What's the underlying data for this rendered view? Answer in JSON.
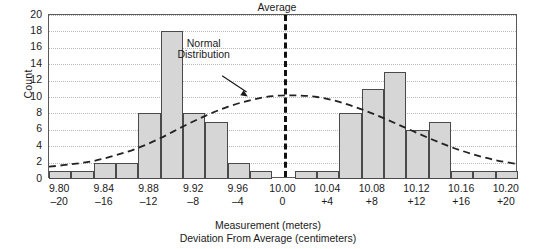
{
  "chart_data": {
    "type": "bar",
    "title": "",
    "ylabel": "Count",
    "xlabel": "Measurement (meters)",
    "xlabel2": "Deviation From Average (centimeters)",
    "ylim": [
      0,
      20
    ],
    "ytick_step": 2,
    "yticks": [
      0,
      2,
      4,
      6,
      8,
      10,
      12,
      14,
      16,
      18,
      20
    ],
    "grid": true,
    "legend": "none",
    "bin_width_meters": 0.02,
    "bin_width_cm": 2,
    "x_start_meters": 9.79,
    "x_end_meters": 10.21,
    "categories": [
      "9.79-9.81",
      "9.81-9.83",
      "9.83-9.85",
      "9.85-9.87",
      "9.87-9.89",
      "9.89-9.91",
      "9.91-9.93",
      "9.93-9.95",
      "9.95-9.97",
      "9.97-9.99",
      "9.99-10.01",
      "10.01-10.03",
      "10.03-10.05",
      "10.05-10.07",
      "10.07-10.09",
      "10.09-10.11",
      "10.11-10.13",
      "10.13-10.15",
      "10.15-10.17",
      "10.17-10.19",
      "10.19-10.21"
    ],
    "values": [
      1,
      1,
      2,
      2,
      8,
      18,
      8,
      7,
      2,
      1,
      0,
      1,
      1,
      8,
      11,
      13,
      6,
      7,
      1,
      1,
      1
    ],
    "xtick_measure": [
      "9.80",
      "9.84",
      "9.88",
      "9.92",
      "9.96",
      "10.00",
      "10.04",
      "10.08",
      "10.12",
      "10.16",
      "10.20"
    ],
    "xtick_deviation": [
      "–20",
      "–16",
      "–12",
      "–8",
      "–4",
      "0",
      "+4",
      "+8",
      "+12",
      "+16",
      "+20"
    ],
    "annotations": [
      {
        "name": "average",
        "label": "Average",
        "x_meters": 10.0,
        "style": "vertical-dashed-line"
      },
      {
        "name": "normal-distribution",
        "label_line1": "Normal",
        "label_line2": "Distribution",
        "style": "dashed-curve-with-arrow"
      }
    ],
    "normal_curve": {
      "label": "Normal Distribution",
      "peak_count": 10.2,
      "peak_x_meters": 10.0,
      "points": [
        {
          "x": 9.79,
          "y": 1.5
        },
        {
          "x": 9.81,
          "y": 1.8
        },
        {
          "x": 9.83,
          "y": 2.2
        },
        {
          "x": 9.85,
          "y": 2.9
        },
        {
          "x": 9.87,
          "y": 3.8
        },
        {
          "x": 9.89,
          "y": 5.0
        },
        {
          "x": 9.91,
          "y": 6.4
        },
        {
          "x": 9.93,
          "y": 7.7
        },
        {
          "x": 9.95,
          "y": 8.8
        },
        {
          "x": 9.97,
          "y": 9.6
        },
        {
          "x": 9.99,
          "y": 10.1
        },
        {
          "x": 10.01,
          "y": 10.2
        },
        {
          "x": 10.03,
          "y": 10.0
        },
        {
          "x": 10.05,
          "y": 9.4
        },
        {
          "x": 10.07,
          "y": 8.5
        },
        {
          "x": 10.09,
          "y": 7.4
        },
        {
          "x": 10.11,
          "y": 6.2
        },
        {
          "x": 10.13,
          "y": 5.0
        },
        {
          "x": 10.15,
          "y": 3.9
        },
        {
          "x": 10.17,
          "y": 3.0
        },
        {
          "x": 10.19,
          "y": 2.3
        },
        {
          "x": 10.21,
          "y": 1.8
        }
      ]
    },
    "colors": {
      "bar_fill": "#d6d6d6",
      "bar_stroke": "#4a4a4a",
      "frame": "#5a5a5a",
      "gridline": "#b9b9b9",
      "curve": "#222222",
      "average_line": "#111111",
      "text": "#1a1a1a"
    }
  }
}
